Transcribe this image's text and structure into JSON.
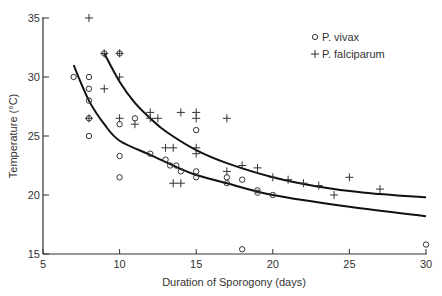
{
  "chart_data": {
    "type": "scatter",
    "title": "",
    "xlabel": "Duration of Sporogony (days)",
    "ylabel": "Temperature (°C)",
    "xlim": [
      5,
      30
    ],
    "ylim": [
      15,
      35
    ],
    "xticks": [
      5,
      10,
      15,
      20,
      25,
      30
    ],
    "yticks": [
      15,
      20,
      25,
      30,
      35
    ],
    "grid": false,
    "legend_position": "upper right",
    "series": [
      {
        "name": "P. vivax",
        "marker": "circle",
        "points": [
          [
            7,
            30
          ],
          [
            8,
            30
          ],
          [
            8,
            29
          ],
          [
            8,
            28
          ],
          [
            8,
            26.5
          ],
          [
            8,
            25
          ],
          [
            9,
            32
          ],
          [
            10,
            32
          ],
          [
            10,
            26
          ],
          [
            10,
            23.3
          ],
          [
            10,
            21.5
          ],
          [
            11,
            26.5
          ],
          [
            12,
            23.5
          ],
          [
            13,
            23
          ],
          [
            13.3,
            22.5
          ],
          [
            13.7,
            22.5
          ],
          [
            14,
            22
          ],
          [
            15,
            25.5
          ],
          [
            15,
            22
          ],
          [
            15,
            21.5
          ],
          [
            17,
            21.5
          ],
          [
            17,
            21
          ],
          [
            18,
            21.3
          ],
          [
            18,
            15.4
          ],
          [
            19,
            20.4
          ],
          [
            19,
            20.2
          ],
          [
            20,
            20
          ],
          [
            30,
            15.8
          ]
        ],
        "fit_curve": [
          [
            7,
            31
          ],
          [
            8,
            28
          ],
          [
            9,
            26
          ],
          [
            10,
            24.6
          ],
          [
            12,
            23.4
          ],
          [
            14,
            22.2
          ],
          [
            15,
            21.7
          ],
          [
            17,
            21.0
          ],
          [
            20,
            20.0
          ],
          [
            25,
            19.0
          ],
          [
            30,
            18.2
          ]
        ]
      },
      {
        "name": "P. falciparum",
        "marker": "plus",
        "points": [
          [
            8,
            35
          ],
          [
            8,
            26.5
          ],
          [
            9,
            32
          ],
          [
            9,
            29
          ],
          [
            10,
            32
          ],
          [
            10,
            30
          ],
          [
            10,
            26.5
          ],
          [
            11,
            26
          ],
          [
            12,
            27
          ],
          [
            12,
            26.5
          ],
          [
            12.5,
            26.5
          ],
          [
            13,
            24
          ],
          [
            13.5,
            24
          ],
          [
            13.5,
            21
          ],
          [
            14,
            21
          ],
          [
            14,
            27
          ],
          [
            15,
            27
          ],
          [
            15,
            26.5
          ],
          [
            15,
            24
          ],
          [
            15,
            23.5
          ],
          [
            17,
            26.5
          ],
          [
            17,
            22
          ],
          [
            18,
            22.5
          ],
          [
            19,
            22.3
          ],
          [
            20,
            21.5
          ],
          [
            21,
            21.3
          ],
          [
            22,
            21
          ],
          [
            23,
            20.8
          ],
          [
            24,
            20
          ],
          [
            25,
            21.5
          ],
          [
            27,
            20.5
          ]
        ],
        "fit_curve": [
          [
            9,
            32
          ],
          [
            10,
            29.6
          ],
          [
            11,
            27.8
          ],
          [
            12,
            26.5
          ],
          [
            13,
            25.4
          ],
          [
            15,
            23.8
          ],
          [
            17,
            22.7
          ],
          [
            20,
            21.5
          ],
          [
            23,
            20.7
          ],
          [
            26,
            20.2
          ],
          [
            30,
            19.8
          ]
        ]
      }
    ]
  },
  "axes": {
    "x_label": "Duration of Sporogony (days)",
    "y_label": "Temperature (°C)"
  },
  "legend": {
    "items": [
      {
        "symbol": "○",
        "label": "P. vivax"
      },
      {
        "symbol": "+",
        "label": "P. falciparum"
      }
    ]
  },
  "colors": {
    "ink": "#222222",
    "background": "#ffffff"
  }
}
